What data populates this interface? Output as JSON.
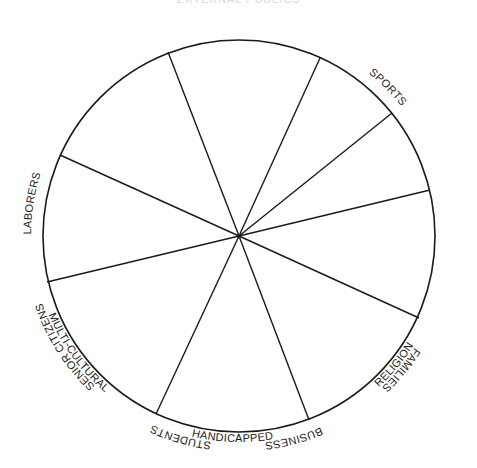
{
  "title": "EXTERNAL PUBLICS",
  "wheel": {
    "center": [
      239,
      236
    ],
    "radius": 196,
    "stroke": "#1a1a1a",
    "spoke_endpoints": [
      [
        168,
        52
      ],
      [
        320,
        58
      ],
      [
        392,
        113
      ],
      [
        430,
        190
      ],
      [
        419,
        318
      ],
      [
        309,
        420
      ],
      [
        156,
        414
      ],
      [
        47,
        282
      ],
      [
        60,
        155
      ]
    ],
    "segments": [
      {
        "label": "FAMILIES"
      },
      {
        "label": "BUSINESS"
      },
      {
        "label": "STUDENTS"
      },
      {
        "label": "SENIOR CITIZENS"
      },
      {
        "label": "RELIGION"
      },
      {
        "label": "HANDICAPPED"
      },
      {
        "label": "MULTI-CULTURAL"
      },
      {
        "label": "LABORERS"
      },
      {
        "label": "SPORTS"
      }
    ]
  }
}
